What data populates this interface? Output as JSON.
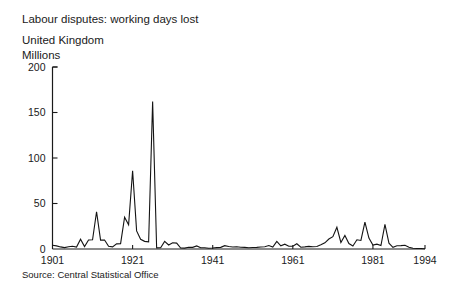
{
  "chart_data": {
    "type": "line",
    "title": "Labour disputes: working days lost",
    "subtitle": "United Kingdom",
    "ylabel": "Millions",
    "xlabel": "",
    "source": "Source: Central Statistical Office",
    "grid": false,
    "legend": "none",
    "xlim": [
      1901,
      1994
    ],
    "ylim": [
      0,
      200
    ],
    "yticks": [
      0,
      50,
      100,
      150,
      200
    ],
    "ytick_labels": [
      "0",
      "50",
      "100",
      "150",
      "200"
    ],
    "xticks": [
      1901,
      1921,
      1941,
      1961,
      1981,
      1994
    ],
    "xtick_labels": [
      "1901",
      "1921",
      "1941",
      "1961",
      "1981",
      "1994"
    ],
    "line_color": "#141414",
    "series": [
      {
        "name": "Working days lost",
        "x": [
          1901,
          1902,
          1903,
          1904,
          1905,
          1906,
          1907,
          1908,
          1909,
          1910,
          1911,
          1912,
          1913,
          1914,
          1915,
          1916,
          1917,
          1918,
          1919,
          1920,
          1921,
          1922,
          1923,
          1924,
          1925,
          1926,
          1927,
          1928,
          1929,
          1930,
          1931,
          1932,
          1933,
          1934,
          1935,
          1936,
          1937,
          1938,
          1939,
          1940,
          1941,
          1942,
          1943,
          1944,
          1945,
          1946,
          1947,
          1948,
          1949,
          1950,
          1951,
          1952,
          1953,
          1954,
          1955,
          1956,
          1957,
          1958,
          1959,
          1960,
          1961,
          1962,
          1963,
          1964,
          1965,
          1966,
          1967,
          1968,
          1969,
          1970,
          1971,
          1972,
          1973,
          1974,
          1975,
          1976,
          1977,
          1978,
          1979,
          1980,
          1981,
          1982,
          1983,
          1984,
          1985,
          1986,
          1987,
          1988,
          1989,
          1990,
          1991,
          1992,
          1993,
          1994
        ],
        "values": [
          4.1,
          3.4,
          2.3,
          1.5,
          2.4,
          3.0,
          2.1,
          10.8,
          2.7,
          9.9,
          10.2,
          40.9,
          9.8,
          9.9,
          3.0,
          2.4,
          5.6,
          5.9,
          34.9,
          26.6,
          85.9,
          19.9,
          10.7,
          8.4,
          7.9,
          162.2,
          1.2,
          1.4,
          8.3,
          4.4,
          6.9,
          6.5,
          1.1,
          1.0,
          2.0,
          1.8,
          3.4,
          1.3,
          1.4,
          0.9,
          1.1,
          1.5,
          1.8,
          3.7,
          2.8,
          2.2,
          2.4,
          2.0,
          1.8,
          1.4,
          1.7,
          1.8,
          2.2,
          2.5,
          3.8,
          2.1,
          8.4,
          3.5,
          5.3,
          3.0,
          3.0,
          5.8,
          2.0,
          2.3,
          2.9,
          2.4,
          2.8,
          4.7,
          6.8,
          11.0,
          13.6,
          23.9,
          7.2,
          14.8,
          6.0,
          3.3,
          10.1,
          9.4,
          29.5,
          12.0,
          4.3,
          5.3,
          3.8,
          27.1,
          6.4,
          1.9,
          3.5,
          3.7,
          4.1,
          1.9,
          0.8,
          0.5,
          0.6,
          0.3
        ]
      }
    ]
  }
}
